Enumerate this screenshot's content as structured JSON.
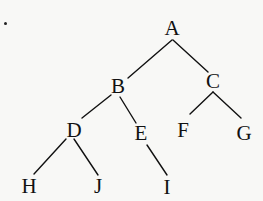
{
  "diagram": {
    "type": "binary-tree",
    "stroke_color": "#111111",
    "background_color": "#f8f8f6",
    "marker": {
      "x": 5,
      "y": 23
    },
    "nodes": [
      {
        "id": "A",
        "label": "A",
        "x": 172,
        "y": 28
      },
      {
        "id": "B",
        "label": "B",
        "x": 118,
        "y": 86
      },
      {
        "id": "C",
        "label": "C",
        "x": 213,
        "y": 81
      },
      {
        "id": "D",
        "label": "D",
        "x": 74,
        "y": 130
      },
      {
        "id": "E",
        "label": "E",
        "x": 141,
        "y": 133
      },
      {
        "id": "F",
        "label": "F",
        "x": 183,
        "y": 130
      },
      {
        "id": "G",
        "label": "G",
        "x": 244,
        "y": 133
      },
      {
        "id": "H",
        "label": "H",
        "x": 29,
        "y": 186
      },
      {
        "id": "J",
        "label": "J",
        "x": 98,
        "y": 186
      },
      {
        "id": "I",
        "label": "I",
        "x": 167,
        "y": 187
      }
    ],
    "edges": [
      {
        "from": "A",
        "to": "B",
        "x1": 172,
        "y1": 40,
        "x2": 128,
        "y2": 78
      },
      {
        "from": "A",
        "to": "C",
        "x1": 173,
        "y1": 40,
        "x2": 208,
        "y2": 72
      },
      {
        "from": "B",
        "to": "D",
        "x1": 111,
        "y1": 95,
        "x2": 82,
        "y2": 118
      },
      {
        "from": "B",
        "to": "E",
        "x1": 120,
        "y1": 97,
        "x2": 136,
        "y2": 123
      },
      {
        "from": "C",
        "to": "F",
        "x1": 213,
        "y1": 92,
        "x2": 190,
        "y2": 114
      },
      {
        "from": "C",
        "to": "G",
        "x1": 213,
        "y1": 92,
        "x2": 241,
        "y2": 118
      },
      {
        "from": "D",
        "to": "H",
        "x1": 66,
        "y1": 139,
        "x2": 34,
        "y2": 174
      },
      {
        "from": "D",
        "to": "J",
        "x1": 74,
        "y1": 139,
        "x2": 98,
        "y2": 175
      },
      {
        "from": "E",
        "to": "I",
        "x1": 147,
        "y1": 145,
        "x2": 167,
        "y2": 175
      }
    ]
  }
}
